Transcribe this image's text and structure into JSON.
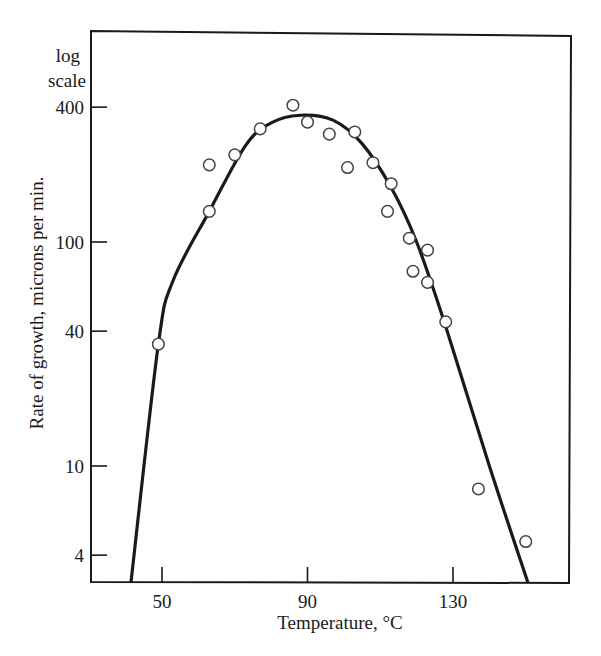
{
  "chart_data": {
    "type": "scatter",
    "title": "",
    "xlabel": "Temperature, °C",
    "ylabel": "Rate of growth, microns per min.",
    "y_scale_note": [
      "log",
      "scale"
    ],
    "yscale": "log",
    "xlim": [
      38,
      161
    ],
    "ylim": [
      3.05,
      560
    ],
    "x_ticks": [
      50,
      90,
      130
    ],
    "x_tick_labels": [
      "50",
      "90",
      "130"
    ],
    "y_ticks": [
      4,
      10,
      40,
      100,
      400
    ],
    "y_tick_labels": [
      "4",
      "10",
      "40",
      "100",
      "400"
    ],
    "grid": false,
    "legend": null,
    "series": [
      {
        "name": "Observed growth rate",
        "style": "open circles",
        "points": [
          {
            "x": 49,
            "y": 35
          },
          {
            "x": 63,
            "y": 137
          },
          {
            "x": 63,
            "y": 221
          },
          {
            "x": 70,
            "y": 245
          },
          {
            "x": 77,
            "y": 320
          },
          {
            "x": 86,
            "y": 408
          },
          {
            "x": 90,
            "y": 343
          },
          {
            "x": 96,
            "y": 303
          },
          {
            "x": 101,
            "y": 215
          },
          {
            "x": 103,
            "y": 310
          },
          {
            "x": 108,
            "y": 226
          },
          {
            "x": 113,
            "y": 182
          },
          {
            "x": 112,
            "y": 137
          },
          {
            "x": 118,
            "y": 104
          },
          {
            "x": 123,
            "y": 92
          },
          {
            "x": 119,
            "y": 74
          },
          {
            "x": 123,
            "y": 66
          },
          {
            "x": 128,
            "y": 44
          },
          {
            "x": 137,
            "y": 7.9
          },
          {
            "x": 150,
            "y": 4.6
          }
        ]
      },
      {
        "name": "Fitted curve",
        "style": "solid line",
        "points": [
          {
            "x": 41.5,
            "y": 3.05
          },
          {
            "x": 49,
            "y": 35
          },
          {
            "x": 53,
            "y": 67
          },
          {
            "x": 63,
            "y": 137
          },
          {
            "x": 73,
            "y": 270
          },
          {
            "x": 80,
            "y": 340
          },
          {
            "x": 88,
            "y": 368
          },
          {
            "x": 97,
            "y": 350
          },
          {
            "x": 105,
            "y": 275
          },
          {
            "x": 113,
            "y": 175
          },
          {
            "x": 120,
            "y": 100
          },
          {
            "x": 128,
            "y": 42
          },
          {
            "x": 140,
            "y": 10
          },
          {
            "x": 150.5,
            "y": 3.05
          }
        ]
      }
    ]
  },
  "colors": {
    "ink": "#1a1a1a",
    "background": "#ffffff"
  }
}
